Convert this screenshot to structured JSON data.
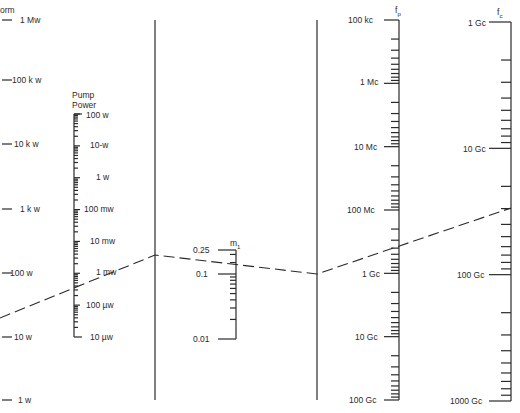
{
  "chart_data": {
    "type": "nomogram",
    "title": "",
    "scales": [
      {
        "id": "pnorm",
        "title": "Pnorm (partially visible: \"orm\")",
        "ticks": [
          "1 Mw",
          "100 k w",
          "10 k w",
          "1 k w",
          "100 w",
          "10 w",
          "1 w"
        ]
      },
      {
        "id": "pump_power",
        "title": "Pump Power",
        "ticks": [
          "100 w",
          "10-w",
          "1 w",
          "100 mw",
          "10 mw",
          "1 mw",
          "100 µw",
          "10 µw"
        ]
      },
      {
        "id": "reference_1",
        "title": "",
        "ticks": []
      },
      {
        "id": "m1",
        "title": "m1",
        "ticks": [
          "0.25",
          "0.1",
          "0.01"
        ]
      },
      {
        "id": "reference_2",
        "title": "",
        "ticks": []
      },
      {
        "id": "fp",
        "title": "fp",
        "ticks": [
          "100 kc",
          "1 Mc",
          "10 Mc",
          "100 Mc",
          "1 Gc",
          "10 Gc",
          "100 Gc"
        ]
      },
      {
        "id": "fc",
        "title": "fc",
        "ticks": [
          "1 Gc",
          "10 Gc",
          "100 Gc",
          "1000 Gc"
        ]
      }
    ],
    "example_isopleth": {
      "style": "dashed",
      "path": [
        "Pnorm ≈ 30 w",
        "Pump Power ≈ 0.5 mw",
        "reference_1",
        "m1 ≈ 0.2",
        "reference_2",
        "fp ≈ 0.5 Gc",
        "fc ≈ 20 Gc"
      ]
    }
  },
  "labels": {
    "pnorm_title": "orm",
    "pump_title_1": "Pump",
    "pump_title_2": "Power",
    "m1_title": "m",
    "m1_sub": "1",
    "fp_title": "f",
    "fp_sub": "p",
    "fc_title": "f",
    "fc_sub": "c"
  },
  "pnorm_ticks": [
    "1 Mw",
    "100 k w",
    "10 k w",
    "1 k w",
    "100 w",
    "10 w",
    "1 w"
  ],
  "pump_ticks": [
    "100 w",
    "10-w",
    "1 w",
    "100 mw",
    "10 mw",
    "1 mw",
    "100 µw",
    "10 µw"
  ],
  "m1_ticks": [
    "0.25",
    "0.1",
    "0.01"
  ],
  "fp_ticks": [
    "100 kc",
    "1 Mc",
    "10 Mc",
    "100 Mc",
    "1 Gc",
    "10 Gc",
    "100 Gc"
  ],
  "fc_ticks": [
    "1 Gc",
    "10 Gc",
    "100 Gc",
    "1000 Gc"
  ],
  "colors": {
    "ink": "#2a2a2a",
    "background": "#ffffff"
  }
}
